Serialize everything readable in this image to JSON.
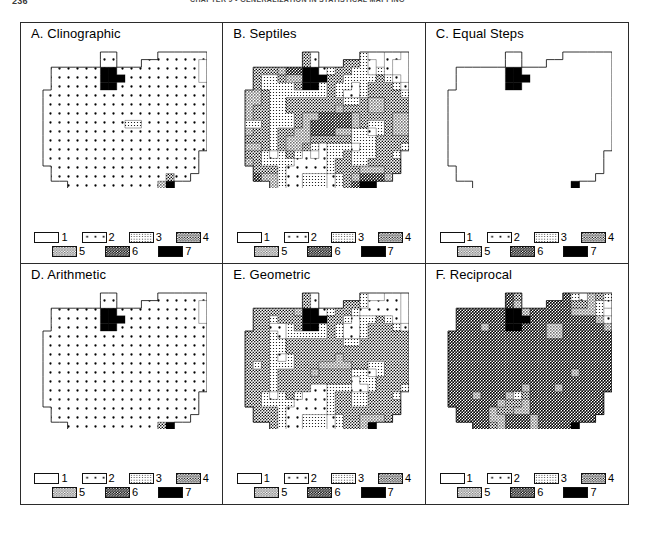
{
  "header": {
    "folio": "236",
    "chapter_title": "CHAPTER 9 • GENERALIZATION IN STATISTICAL MAPPING"
  },
  "legend": {
    "classes": [
      {
        "id": "1",
        "label": "1",
        "fill": "white",
        "description": "blank / white"
      },
      {
        "id": "2",
        "label": "2",
        "fill": "dots-sparse",
        "description": "sparse dot stipple"
      },
      {
        "id": "3",
        "label": "3",
        "fill": "dots-fine",
        "description": "fine light stipple"
      },
      {
        "id": "4",
        "label": "4",
        "fill": "dots-medium",
        "description": "medium cross stipple"
      },
      {
        "id": "5",
        "label": "5",
        "fill": "gray-stipple",
        "description": "gray stipple"
      },
      {
        "id": "6",
        "label": "6",
        "fill": "dark-stipple",
        "description": "dark dense stipple"
      },
      {
        "id": "7",
        "label": "7",
        "fill": "solid-black",
        "description": "solid black"
      }
    ],
    "row_a_ids": [
      "1",
      "2",
      "3",
      "4"
    ],
    "row_b_ids": [
      "5",
      "6",
      "7"
    ]
  },
  "panels": [
    {
      "key": "a",
      "title": "A. Clinographic",
      "method": "Clinographic",
      "chart_data": {
        "type": "map",
        "title": "A. Clinographic",
        "classes": [
          "1",
          "2",
          "3",
          "4",
          "5",
          "6",
          "7"
        ],
        "dominant_class": "2",
        "class_area_share": [
          0.06,
          0.72,
          0.05,
          0.07,
          0.02,
          0.03,
          0.05
        ],
        "note": "Most enumeration units fall in class 2; black (7) concentrated in one central-north unit, one small class-7 block in lower right."
      }
    },
    {
      "key": "b",
      "title": "B. Septiles",
      "method": "Septiles",
      "chart_data": {
        "type": "map",
        "title": "B. Septiles",
        "classes": [
          "1",
          "2",
          "3",
          "4",
          "5",
          "6",
          "7"
        ],
        "dominant_class": "6",
        "class_area_share": [
          0.14,
          0.13,
          0.14,
          0.15,
          0.15,
          0.15,
          0.14
        ],
        "note": "Equal-count classification; all seven classes receive nearly equal numbers of units, producing a highly variegated pattern."
      }
    },
    {
      "key": "c",
      "title": "C. Equal Steps",
      "method": "Equal Steps",
      "chart_data": {
        "type": "map",
        "title": "C. Equal Steps",
        "classes": [
          "1",
          "2",
          "3",
          "4",
          "5",
          "6",
          "7"
        ],
        "dominant_class": "1",
        "class_area_share": [
          0.93,
          0.03,
          0.01,
          0.02,
          0.0,
          0.0,
          0.01
        ],
        "note": "Equal value intervals place nearly every unit in class 1; only the extreme outlier unit is black (7)."
      }
    },
    {
      "key": "d",
      "title": "D. Arithmetic",
      "method": "Arithmetic",
      "chart_data": {
        "type": "map",
        "title": "D. Arithmetic",
        "classes": [
          "1",
          "2",
          "3",
          "4",
          "5",
          "6",
          "7"
        ],
        "dominant_class": "2",
        "class_area_share": [
          0.07,
          0.8,
          0.03,
          0.04,
          0.01,
          0.03,
          0.02
        ],
        "note": "Arithmetic progression of class limits; class 2 dominates, with isolated class-6 and class-7 units."
      }
    },
    {
      "key": "e",
      "title": "E. Geometric",
      "method": "Geometric",
      "chart_data": {
        "type": "map",
        "title": "E. Geometric",
        "classes": [
          "1",
          "2",
          "3",
          "4",
          "5",
          "6",
          "7"
        ],
        "dominant_class": "4",
        "class_area_share": [
          0.12,
          0.18,
          0.1,
          0.34,
          0.2,
          0.04,
          0.02
        ],
        "note": "Geometric progression shifts the distribution toward middle classes 4 and 5."
      }
    },
    {
      "key": "f",
      "title": "F. Reciprocal",
      "method": "Reciprocal",
      "chart_data": {
        "type": "map",
        "title": "F. Reciprocal",
        "classes": [
          "1",
          "2",
          "3",
          "4",
          "5",
          "6",
          "7"
        ],
        "dominant_class": "6",
        "class_area_share": [
          0.04,
          0.06,
          0.03,
          0.03,
          0.12,
          0.7,
          0.02
        ],
        "note": "Reciprocal class limits push almost all units into the darkest stipple class 6."
      }
    }
  ]
}
